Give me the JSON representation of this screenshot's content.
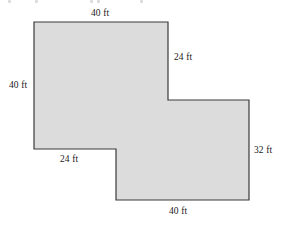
{
  "figure": {
    "name": "composite-rectilinear-figure",
    "unit": "ft",
    "fill_color": "#dcdcdc",
    "stroke_color": "#3a3a3a",
    "background_color": "#ffffff",
    "vertices": [
      [
        34,
        22
      ],
      [
        168,
        22
      ],
      [
        168,
        100
      ],
      [
        249,
        100
      ],
      [
        249,
        200
      ],
      [
        116,
        200
      ],
      [
        116,
        149
      ],
      [
        34,
        149
      ]
    ],
    "labels": {
      "top": "40 ft",
      "left": "40 ft",
      "upper_right": "24 ft",
      "right": "32 ft",
      "inner_bottom_left": "24 ft",
      "bottom": "40 ft"
    },
    "label_values": {
      "top": 40,
      "left": 40,
      "upper_right": 24,
      "right": 32,
      "inner_bottom_left": 24,
      "bottom": 40
    }
  }
}
